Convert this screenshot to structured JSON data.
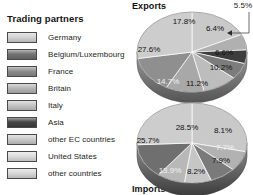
{
  "legend": {
    "title": "Trading partners",
    "items": [
      {
        "label": "Germany",
        "color": "#d2d2d2",
        "swatch_name": "legend-swatch-germany"
      },
      {
        "label": "Belgium/Luxembourg",
        "color": "#6e6e6e",
        "swatch_name": "legend-swatch-belgium-luxembourg"
      },
      {
        "label": "France",
        "color": "#8a8a8a",
        "swatch_name": "legend-swatch-france"
      },
      {
        "label": "Britain",
        "color": "#b4b4b4",
        "swatch_name": "legend-swatch-britain"
      },
      {
        "label": "Italy",
        "color": "#c4c4c4",
        "swatch_name": "legend-swatch-italy"
      },
      {
        "label": "Asia",
        "color": "#3f3f3f",
        "swatch_name": "legend-swatch-asia"
      },
      {
        "label": "other EC countries",
        "color": "#cacaca",
        "swatch_name": "legend-swatch-other-ec-countries"
      },
      {
        "label": "United States",
        "color": "#dcdcdc",
        "swatch_name": "legend-swatch-united-states"
      },
      {
        "label": "other countries",
        "color": "#d7d7d7",
        "swatch_name": "legend-swatch-other-countries"
      }
    ]
  },
  "captions": {
    "exports": "Exports",
    "imports": "Imports",
    "callout_value": "5.5%"
  },
  "chart_data": [
    {
      "type": "pie",
      "title": "Exports",
      "categories": [
        "Germany",
        "Belgium/Luxembourg",
        "France",
        "Britain",
        "Italy",
        "Asia",
        "other EC countries",
        "United States",
        "other countries"
      ],
      "values": [
        27.6,
        6.6,
        10.2,
        11.2,
        14.7,
        5.5,
        6.4,
        17.8,
        0
      ],
      "labels": [
        "27.6%",
        "6.6%",
        "10.2%",
        "11.2%",
        "14.7%",
        "5.5%",
        "6.4%",
        "17.8%",
        ""
      ],
      "unit": "percent",
      "legend_position": "left",
      "callout_slice": "Asia",
      "callout_label": "5.5%"
    },
    {
      "type": "pie",
      "title": "Imports",
      "categories": [
        "Germany",
        "Belgium/Luxembourg",
        "France",
        "Britain",
        "Italy",
        "Asia",
        "other EC countries",
        "United States",
        "other countries"
      ],
      "values": [
        25.7,
        7.7,
        7.9,
        8.2,
        13.9,
        8.1,
        28.5,
        0,
        0
      ],
      "labels": [
        "25.7%",
        "7.7%",
        "7.9%",
        "8.2%",
        "13.9%",
        "8.1%",
        "28.5%",
        "",
        ""
      ],
      "unit": "percent",
      "legend_position": "left"
    }
  ],
  "exports_slices": [
    {
      "name": "other-ec-countries",
      "label": "17.8%",
      "value": 17.8,
      "color": "#c9c9c9",
      "lx": 53,
      "ly": 22,
      "light": false
    },
    {
      "name": "united-states",
      "label": "6.4%",
      "value": 6.4,
      "color": "#b0b0b0",
      "lx": 84,
      "ly": 29,
      "light": false
    },
    {
      "name": "asia",
      "label": "5.5%",
      "value": 5.5,
      "color": "#3d3d3d",
      "lx": 0,
      "ly": 0,
      "light": true
    },
    {
      "name": "belgium-luxembourg",
      "label": "6.6%",
      "value": 6.6,
      "color": "#7c7c7c",
      "lx": 93,
      "ly": 53,
      "light": false
    },
    {
      "name": "france",
      "label": "10.2%",
      "value": 10.2,
      "color": "#bdbdbd",
      "lx": 90,
      "ly": 68,
      "light": false
    },
    {
      "name": "britain",
      "label": "11.2%",
      "value": 11.2,
      "color": "#a8a8a8",
      "lx": 66,
      "ly": 84,
      "light": false
    },
    {
      "name": "italy",
      "label": "14.7%",
      "value": 14.7,
      "color": "#8f8f8f",
      "lx": 37,
      "ly": 82,
      "light": true
    },
    {
      "name": "germany",
      "label": "27.6%",
      "value": 27.6,
      "color": "#cdcdcd",
      "lx": 18,
      "ly": 50,
      "light": false
    }
  ],
  "imports_slices": [
    {
      "name": "other-ec-countries",
      "label": "28.5%",
      "value": 28.5,
      "color": "#c9c9c9",
      "lx": 56,
      "ly": 128,
      "light": false
    },
    {
      "name": "asia",
      "label": "8.1%",
      "value": 8.1,
      "color": "#b2b2b2",
      "lx": 92,
      "ly": 131,
      "light": false
    },
    {
      "name": "belgium-luxembourg",
      "label": "7.7%",
      "value": 7.7,
      "color": "#7a7a7a",
      "lx": 94,
      "ly": 148,
      "light": true
    },
    {
      "name": "france",
      "label": "7.9%",
      "value": 7.9,
      "color": "#c6c6c6",
      "lx": 90,
      "ly": 161,
      "light": false
    },
    {
      "name": "britain",
      "label": "8.2%",
      "value": 8.2,
      "color": "#b8b8b8",
      "lx": 65,
      "ly": 172,
      "light": false
    },
    {
      "name": "italy",
      "label": "13.9%",
      "value": 13.9,
      "color": "#6f6f6f",
      "lx": 39,
      "ly": 171,
      "light": true
    },
    {
      "name": "germany",
      "label": "25.7%",
      "value": 25.7,
      "color": "#cdcdcd",
      "lx": 17,
      "ly": 141,
      "light": false
    }
  ]
}
